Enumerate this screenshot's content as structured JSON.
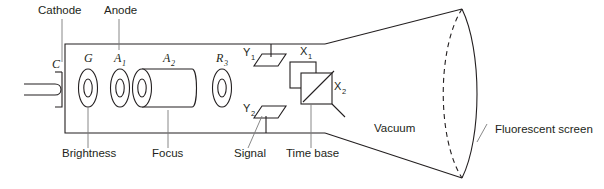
{
  "figure": {
    "background_color": "#ffffff",
    "line_color": "#231f20",
    "leader_color": "#7a7a7a"
  },
  "top_labels": [
    {
      "id": "cathode",
      "text": "Cathode",
      "x": 38,
      "y": 14,
      "leader_x": 62,
      "leader_y1": 19,
      "leader_y2": 62
    },
    {
      "id": "anode",
      "text": "Anode",
      "x": 104,
      "y": 14,
      "leader_x": 119,
      "leader_y1": 19,
      "leader_y2": 50
    }
  ],
  "bottom_labels": [
    {
      "id": "brightness",
      "text": "Brightness",
      "x": 62,
      "y": 157,
      "leader_x": 88,
      "leader_y1": 107,
      "leader_y2": 148
    },
    {
      "id": "focus",
      "text": "Focus",
      "x": 152,
      "y": 157,
      "leader_x": 168,
      "leader_y1": 110,
      "leader_y2": 148
    },
    {
      "id": "signal",
      "text": "Signal",
      "x": 234,
      "y": 157,
      "leader_x": 262,
      "leader_y1": 115,
      "leader_y2": 148
    },
    {
      "id": "time-base",
      "text": "Time base",
      "x": 286,
      "y": 157,
      "leader_x": 311,
      "leader_y1": 104,
      "leader_y2": 148
    }
  ],
  "electrodes": [
    {
      "id": "cathode-c",
      "label": "C",
      "sub": "",
      "cx": 55,
      "cy": 88
    },
    {
      "id": "grid-g",
      "label": "G",
      "sub": "",
      "cx": 88,
      "cy": 88
    },
    {
      "id": "anode-a1",
      "label": "A",
      "sub": "1",
      "cx": 120,
      "cy": 88
    },
    {
      "id": "anode-a2",
      "label": "A",
      "sub": "2",
      "cx": 168,
      "cy": 88
    },
    {
      "id": "anode-r3",
      "label": "R",
      "sub": "3",
      "cx": 222,
      "cy": 88
    }
  ],
  "deflection_plates": [
    {
      "id": "plate-y1",
      "label": "Y",
      "sub": "1",
      "x": 243,
      "y": 56
    },
    {
      "id": "plate-y2",
      "label": "Y",
      "sub": "2",
      "x": 243,
      "y": 112
    },
    {
      "id": "plate-x1",
      "label": "X",
      "sub": "1",
      "x": 300,
      "y": 55
    },
    {
      "id": "plate-x2",
      "label": "X",
      "sub": "2",
      "x": 327,
      "y": 90
    }
  ],
  "region_labels": [
    {
      "id": "vacuum",
      "text": "Vacuum",
      "x": 374,
      "y": 132
    },
    {
      "id": "fluorescent-screen",
      "text": "Fluorescent screen",
      "x": 495,
      "y": 133,
      "leader_x1": 487,
      "leader_y1": 124,
      "leader_x2": 477,
      "leader_y2": 142
    }
  ]
}
